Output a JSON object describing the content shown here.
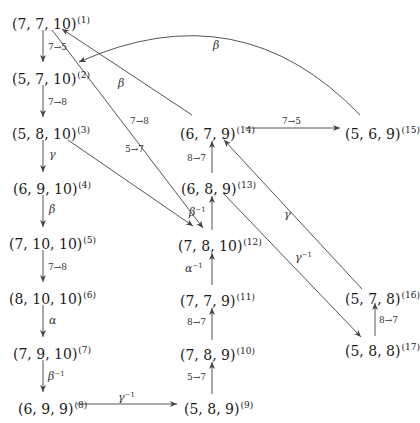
{
  "diagram": {
    "type": "state-transition-graph",
    "nodes": [
      {
        "id": 1,
        "label": "(7, 7, 10)",
        "index": "(1)"
      },
      {
        "id": 2,
        "label": "(5, 7, 10)",
        "index": "(2)"
      },
      {
        "id": 3,
        "label": "(5, 8, 10)",
        "index": "(3)"
      },
      {
        "id": 4,
        "label": "(6, 9, 10)",
        "index": "(4)"
      },
      {
        "id": 5,
        "label": "(7, 10, 10)",
        "index": "(5)"
      },
      {
        "id": 6,
        "label": "(8, 10, 10)",
        "index": "(6)"
      },
      {
        "id": 7,
        "label": "(7, 9, 10)",
        "index": "(7)"
      },
      {
        "id": 8,
        "label": "(6, 9, 9)",
        "index": "(8)"
      },
      {
        "id": 9,
        "label": "(5, 8, 9)",
        "index": "(9)"
      },
      {
        "id": 10,
        "label": "(7, 8, 9)",
        "index": "(10)"
      },
      {
        "id": 11,
        "label": "(7, 7, 9)",
        "index": "(11)"
      },
      {
        "id": 12,
        "label": "(7, 8, 10)",
        "index": "(12)"
      },
      {
        "id": 13,
        "label": "(6, 8, 9)",
        "index": "(13)"
      },
      {
        "id": 14,
        "label": "(6, 7, 9)",
        "index": "(14)"
      },
      {
        "id": 15,
        "label": "(5, 6, 9)",
        "index": "(15)"
      },
      {
        "id": 16,
        "label": "(5, 7, 8)",
        "index": "(16)"
      },
      {
        "id": 17,
        "label": "(5, 8, 8)",
        "index": "(17)"
      }
    ],
    "edges": [
      {
        "from": 1,
        "to": 2,
        "label": "7→5"
      },
      {
        "from": 2,
        "to": 3,
        "label": "7→8"
      },
      {
        "from": 3,
        "to": 4,
        "label": "γ"
      },
      {
        "from": 4,
        "to": 5,
        "label": "β"
      },
      {
        "from": 5,
        "to": 6,
        "label": "7→8"
      },
      {
        "from": 6,
        "to": 7,
        "label": "α"
      },
      {
        "from": 7,
        "to": 8,
        "label": "β",
        "sup": "−1"
      },
      {
        "from": 8,
        "to": 9,
        "label": "γ",
        "sup": "−1"
      },
      {
        "from": 9,
        "to": 10,
        "label": "5→7"
      },
      {
        "from": 10,
        "to": 11,
        "label": "8→7"
      },
      {
        "from": 11,
        "to": 12,
        "label": "α",
        "sup": "−1"
      },
      {
        "from": 12,
        "to": 13,
        "label": "β",
        "sup": "−1"
      },
      {
        "from": 13,
        "to": 14,
        "label": "8→7"
      },
      {
        "from": 14,
        "to": 15,
        "label": "7→5"
      },
      {
        "from": 14,
        "to": 1,
        "label": "β"
      },
      {
        "from": 15,
        "to": 2,
        "label": "β"
      },
      {
        "from": 1,
        "to": 12,
        "label": "7→8"
      },
      {
        "from": 3,
        "to": 12,
        "label": "5→7"
      },
      {
        "from": 13,
        "to": 17,
        "label": "γ",
        "sup": "−1"
      },
      {
        "from": 17,
        "to": 16,
        "label": "8→7"
      },
      {
        "from": 16,
        "to": 14,
        "label": "γ"
      }
    ]
  }
}
